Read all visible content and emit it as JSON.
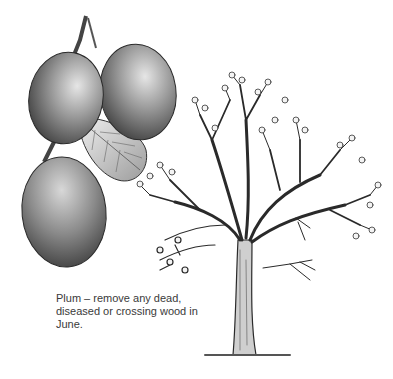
{
  "figure": {
    "subject": "Plum",
    "caption_lines": [
      "Plum – remove any dead,",
      "diseased or crossing wood in",
      "June."
    ]
  },
  "colors": {
    "background": "#ffffff",
    "ink": "#222222",
    "caption": "#3a3a3a"
  }
}
